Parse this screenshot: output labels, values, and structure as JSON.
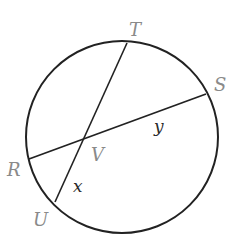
{
  "diagram": {
    "type": "circle-intersecting-chords",
    "colors": {
      "stroke": "#222222",
      "point_label": "#8a8a8a",
      "variable_label": "#2a2a2a",
      "background": "#ffffff"
    },
    "circle": {
      "cx": 122,
      "cy": 137,
      "r": 96
    },
    "points": {
      "T": {
        "label": "T",
        "x": 127,
        "y": 43
      },
      "S": {
        "label": "S",
        "x": 206,
        "y": 94
      },
      "R": {
        "label": "R",
        "x": 29,
        "y": 159
      },
      "U": {
        "label": "U",
        "x": 55,
        "y": 202
      },
      "V": {
        "label": "V",
        "x": 85,
        "y": 137
      }
    },
    "chords": [
      {
        "name": "TU",
        "from": "T",
        "to": "U"
      },
      {
        "name": "RS",
        "from": "R",
        "to": "S"
      }
    ],
    "labels": {
      "T": "T",
      "S": "S",
      "R": "R",
      "U": "U",
      "V": "V",
      "x": "x",
      "y": "y"
    },
    "segment_labels": [
      {
        "segment": "VU",
        "label": "x"
      },
      {
        "segment": "VS",
        "label": "y"
      }
    ]
  }
}
